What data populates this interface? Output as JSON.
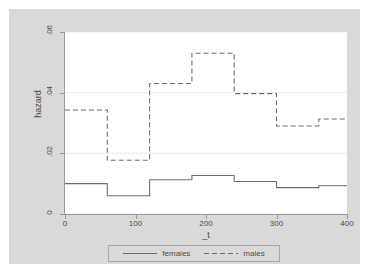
{
  "chart_data": {
    "type": "line",
    "subtype": "step",
    "title": "",
    "xlabel": "_t",
    "ylabel": "hazard",
    "xlim": [
      0,
      400
    ],
    "ylim": [
      0,
      0.06
    ],
    "x_ticks": [
      "0",
      "100",
      "200",
      "300",
      "400"
    ],
    "x_tick_values": [
      0,
      100,
      200,
      300,
      400
    ],
    "y_ticks": [
      "0",
      ".02",
      ".04",
      ".06"
    ],
    "y_tick_values": [
      0,
      0.02,
      0.04,
      0.06
    ],
    "grid": "horizontal",
    "legend_position": "bottom",
    "background_color": "#d9d9d9",
    "plot_background_color": "#ffffff",
    "series": [
      {
        "name": "females",
        "style": "solid",
        "color": "#6e6e6e",
        "step_edges": [
          0,
          60,
          120,
          180,
          240,
          300,
          360,
          400
        ],
        "values": [
          0.01,
          0.006,
          0.0113,
          0.0127,
          0.0107,
          0.0087,
          0.0093
        ]
      },
      {
        "name": "males",
        "style": "dashed",
        "color": "#6e6e6e",
        "step_edges": [
          0,
          60,
          120,
          180,
          240,
          300,
          360,
          400
        ],
        "values": [
          0.0343,
          0.0177,
          0.043,
          0.053,
          0.0397,
          0.029,
          0.0313
        ]
      }
    ]
  },
  "axes": {
    "y_title": "hazard",
    "x_title": "_t",
    "y_tick_labels": [
      "0",
      ".02",
      ".04",
      ".06"
    ],
    "x_tick_labels": [
      "0",
      "100",
      "200",
      "300",
      "400"
    ]
  },
  "legend": {
    "entries": [
      {
        "label": "females",
        "style": "solid"
      },
      {
        "label": "males",
        "style": "dashed"
      }
    ]
  }
}
